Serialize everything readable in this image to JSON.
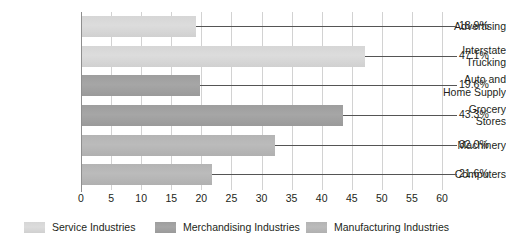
{
  "chart_data": {
    "type": "bar",
    "orientation": "horizontal",
    "title": "",
    "xlabel": "",
    "ylabel": "",
    "xlim": [
      0,
      60
    ],
    "xticks": [
      0,
      5,
      10,
      15,
      20,
      25,
      30,
      35,
      40,
      45,
      50,
      55,
      60
    ],
    "xtick_labels": [
      "0",
      "5",
      "10",
      "15",
      "20",
      "25",
      "30",
      "35",
      "40",
      "45",
      "50",
      "55",
      "60"
    ],
    "grid": true,
    "grid_axis": "x",
    "legend_position": "bottom",
    "categories": [
      "Advertising",
      "Interstate Trucking",
      "Auto and Home Supply",
      "Grocery Stores",
      "Machinery",
      "Computers"
    ],
    "values": [
      18.9,
      47.1,
      19.6,
      43.3,
      32.0,
      21.6
    ],
    "data_labels": [
      "18.9%",
      "47.1%",
      "19.6%",
      "43.3%",
      "32.0%",
      "21.6%"
    ],
    "bars": [
      {
        "category": "Advertising",
        "category_lines": [
          "Advertising"
        ],
        "value": 18.9,
        "label": "18.9%",
        "group": "Service Industries",
        "group_key": "service",
        "color": "#d8d8d8"
      },
      {
        "category": "Interstate Trucking",
        "category_lines": [
          "Interstate",
          "Trucking"
        ],
        "value": 47.1,
        "label": "47.1%",
        "group": "Service Industries",
        "group_key": "service",
        "color": "#d8d8d8"
      },
      {
        "category": "Auto and Home Supply",
        "category_lines": [
          "Auto and",
          "Home Supply"
        ],
        "value": 19.6,
        "label": "19.6%",
        "group": "Merchandising Industries",
        "group_key": "merchandising",
        "color": "#a2a2a2"
      },
      {
        "category": "Grocery Stores",
        "category_lines": [
          "Grocery",
          "Stores"
        ],
        "value": 43.3,
        "label": "43.3%",
        "group": "Merchandising Industries",
        "group_key": "merchandising",
        "color": "#a2a2a2"
      },
      {
        "category": "Machinery",
        "category_lines": [
          "Machinery"
        ],
        "value": 32.0,
        "label": "32.0%",
        "group": "Manufacturing Industries",
        "group_key": "manufacturing",
        "color": "#b7b7b7"
      },
      {
        "category": "Computers",
        "category_lines": [
          "Computers"
        ],
        "value": 21.6,
        "label": "21.6%",
        "group": "Manufacturing Industries",
        "group_key": "manufacturing",
        "color": "#b7b7b7"
      }
    ],
    "legend": [
      {
        "label": "Service Industries",
        "key": "service",
        "color": "#d8d8d8"
      },
      {
        "label": "Merchandising Industries",
        "key": "merchandising",
        "color": "#a2a2a2"
      },
      {
        "label": "Manufacturing Industries",
        "key": "manufacturing",
        "color": "#b7b7b7"
      }
    ]
  },
  "colors": {
    "background": "#ffffff",
    "text": "#231f20",
    "gridline": "#d2d2d2",
    "axis": "#8e8e8e",
    "leader": "#555555"
  }
}
